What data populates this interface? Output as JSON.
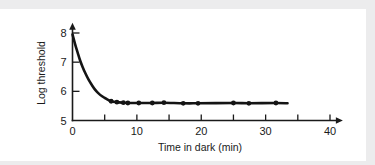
{
  "figure": {
    "background_color": "#ffffff",
    "band_color": "#ececed",
    "ink_color": "#141414"
  },
  "chart_data": {
    "type": "line",
    "title": "",
    "subtitle": "",
    "xlabel": "Time in dark  (min)",
    "ylabel": "Log threshold",
    "xlim": [
      0,
      42
    ],
    "ylim": [
      5,
      8.35
    ],
    "grid": false,
    "legend": null,
    "x_major_ticks": [
      0,
      10,
      20,
      30,
      40
    ],
    "x_minor_ticks": [
      5,
      15,
      25,
      35
    ],
    "x_tick_labels": [
      "0",
      "10",
      "20",
      "30",
      "40"
    ],
    "y_ticks": [
      5,
      6,
      7,
      8
    ],
    "y_tick_labels": [
      "5",
      "6",
      "7",
      "8"
    ],
    "x_axis_arrow": true,
    "y_axis_arrow": true,
    "series": [
      {
        "name": "Dark adaptation curve",
        "marker": "filled-circle",
        "x": [
          0.0,
          0.4,
          0.8,
          1.2,
          1.6,
          2.0,
          2.5,
          3.0,
          3.5,
          4.0,
          4.6,
          5.2,
          6.0,
          6.9,
          7.9,
          8.6,
          10.3,
          12.4,
          14.2,
          17.2,
          19.5,
          25.0,
          27.4,
          31.6,
          33.4
        ],
        "y": [
          7.95,
          7.62,
          7.33,
          7.05,
          6.82,
          6.62,
          6.4,
          6.22,
          6.06,
          5.94,
          5.83,
          5.75,
          5.66,
          5.63,
          5.61,
          5.6,
          5.6,
          5.6,
          5.61,
          5.59,
          5.59,
          5.6,
          5.59,
          5.6,
          5.59
        ],
        "marker_x": [
          6.0,
          6.9,
          7.9,
          8.6,
          10.3,
          12.4,
          14.2,
          17.2,
          19.5,
          25.0,
          27.4,
          31.6
        ],
        "marker_y": [
          5.66,
          5.63,
          5.61,
          5.6,
          5.6,
          5.6,
          5.61,
          5.59,
          5.59,
          5.6,
          5.59,
          5.6
        ]
      }
    ]
  }
}
